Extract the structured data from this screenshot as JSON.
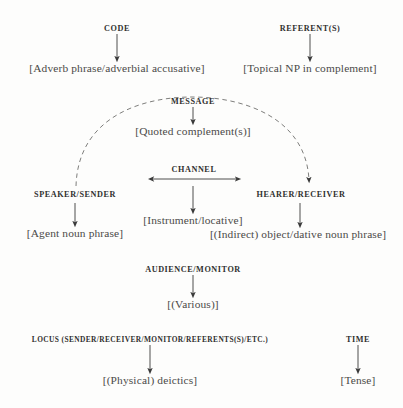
{
  "diagram": {
    "type": "flow-diagram",
    "background_color": "#fdfdfc",
    "text_color": "#3a3a3a",
    "nodes": [
      {
        "id": "code",
        "label": "CODE",
        "realization": "[Adverb phrase/adverbial accusative]"
      },
      {
        "id": "referents",
        "label": "REFERENT(S)",
        "realization": "[Topical NP in complement]"
      },
      {
        "id": "message",
        "label": "MESSAGE",
        "realization": "[Quoted complement(s)]"
      },
      {
        "id": "channel",
        "label": "CHANNEL",
        "realization": "[Instrument/locative]"
      },
      {
        "id": "speaker-sender",
        "label": "SPEAKER/SENDER",
        "realization": "[Agent noun phrase]"
      },
      {
        "id": "hearer-receiver",
        "label": "HEARER/RECEIVER",
        "realization": "[(Indirect) object/dative noun phrase]"
      },
      {
        "id": "audience-monitor",
        "label": "AUDIENCE/MONITOR",
        "realization": "[(Various)]"
      },
      {
        "id": "locus",
        "label": "LOCUS (SENDER/RECEIVER/MONITOR/REFERENTS(S)/ETC.)",
        "realization": "[(Physical) deictics]"
      },
      {
        "id": "time",
        "label": "TIME",
        "realization": "[Tense]"
      }
    ],
    "connectors": [
      {
        "id": "code-arrow",
        "style": "solid",
        "direction": "down"
      },
      {
        "id": "referents-arrow",
        "style": "solid",
        "direction": "down"
      },
      {
        "id": "message-arrow",
        "style": "solid",
        "direction": "down"
      },
      {
        "id": "channel-arrow",
        "style": "solid",
        "direction": "both-horizontal"
      },
      {
        "id": "channel-down",
        "style": "solid",
        "direction": "down"
      },
      {
        "id": "speaker-arrow",
        "style": "solid",
        "direction": "down"
      },
      {
        "id": "hearer-arrow",
        "style": "solid",
        "direction": "down"
      },
      {
        "id": "audience-arrow",
        "style": "solid",
        "direction": "down"
      },
      {
        "id": "locus-arrow",
        "style": "solid",
        "direction": "down"
      },
      {
        "id": "time-arrow",
        "style": "solid",
        "direction": "down"
      },
      {
        "id": "message-arc",
        "style": "dashed",
        "direction": "arc-speaker-to-hearer"
      }
    ]
  }
}
